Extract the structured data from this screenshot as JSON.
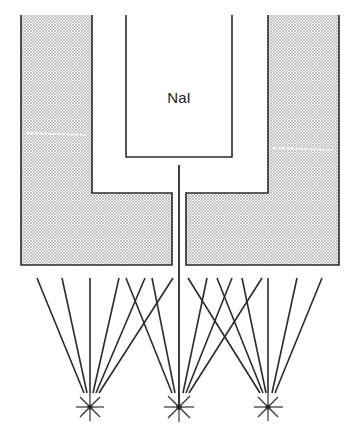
{
  "diagram": {
    "crystal_label": "NaI",
    "colors": {
      "stroke": "#2a2a2a",
      "shield_fill": "#d4d4d4",
      "background": "#ffffff"
    },
    "components": {
      "left_shield": "shielding block (stippled)",
      "right_shield": "shielding block (stippled)",
      "crystal": "NaI",
      "central_wire": "signal line",
      "sources": [
        "source-left",
        "source-center",
        "source-right"
      ]
    }
  }
}
